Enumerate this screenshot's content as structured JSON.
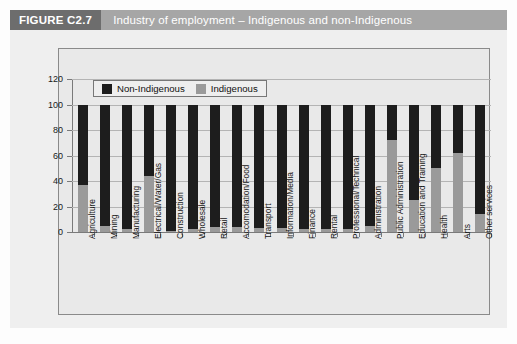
{
  "header": {
    "figure_tag": "FIGURE C2.7",
    "title": "Industry of employment – Indigenous and non-Indigenous"
  },
  "legend": {
    "items": [
      {
        "label": "Non-Indigenous",
        "color": "#1d1d1d"
      },
      {
        "label": "Indigenous",
        "color": "#9a9a9a"
      }
    ]
  },
  "chart_data": {
    "type": "bar",
    "stacked": true,
    "title": "Industry of employment – Indigenous and non-Indigenous",
    "xlabel": "",
    "ylabel": "",
    "ylim": [
      0,
      120
    ],
    "yticks": [
      0,
      20,
      40,
      60,
      80,
      100,
      120
    ],
    "ytick_labels": [
      "0",
      "20",
      "40",
      "60",
      "80",
      "100",
      "120"
    ],
    "grid": true,
    "legend_position": "top-left-inside",
    "categories": [
      "Agriculture",
      "Mining",
      "Manufacturing",
      "Electrical/Water/Gas",
      "Construction",
      "Wholesale",
      "Retail",
      "Accomodation/Food",
      "Transport",
      "Information/Media",
      "Finance",
      "Rental",
      "Professional/Technical",
      "Administration",
      "Public Administration",
      "Education and Training",
      "Health",
      "Arts",
      "Other services"
    ],
    "series": [
      {
        "name": "Indigenous",
        "color": "#9a9a9a",
        "values": [
          37,
          5,
          2,
          44,
          1,
          2,
          4,
          4,
          3,
          3,
          2,
          2,
          2,
          5,
          72,
          25,
          50,
          62,
          14
        ]
      },
      {
        "name": "Non-Indigenous",
        "color": "#1d1d1d",
        "values": [
          63,
          95,
          98,
          56,
          99,
          98,
          96,
          96,
          97,
          97,
          98,
          98,
          98,
          95,
          28,
          75,
          50,
          38,
          86
        ]
      }
    ],
    "total": 100
  }
}
